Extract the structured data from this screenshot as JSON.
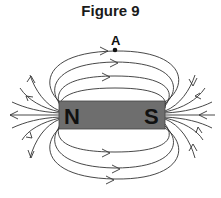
{
  "figure": {
    "title": "Figure 9",
    "point_label": "A",
    "magnet": {
      "north_label": "N",
      "south_label": "S",
      "fill_color": "#6e6e6e"
    },
    "line_color": "#333333"
  }
}
